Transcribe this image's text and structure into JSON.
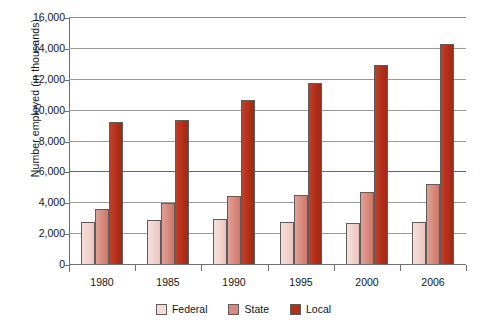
{
  "chart_data": {
    "type": "bar",
    "title": "",
    "xlabel": "",
    "ylabel": "Number employed (in thousands)",
    "categories": [
      "1980",
      "1985",
      "1990",
      "1995",
      "2000",
      "2006"
    ],
    "series": [
      {
        "name": "Federal",
        "color": "#f4dbd5",
        "values": [
          2800,
          2900,
          3000,
          2800,
          2750,
          2780
        ]
      },
      {
        "name": "State",
        "color": "#d8897d",
        "values": [
          3650,
          4000,
          4450,
          4550,
          4750,
          5230
        ]
      },
      {
        "name": "Local",
        "color": "#b5301a",
        "values": [
          9290,
          9420,
          10710,
          11800,
          12970,
          14320
        ]
      }
    ],
    "ylim": [
      0,
      16000
    ],
    "yticks": [
      "0",
      "2,000",
      "4,000",
      "6,000",
      "8,000",
      "10,000",
      "12,000",
      "14,000",
      "16,000"
    ],
    "ytick_values": [
      0,
      2000,
      4000,
      6000,
      8000,
      10000,
      12000,
      14000,
      16000
    ],
    "grid": true,
    "grid_highlight_value": 6000,
    "legend_position": "bottom"
  },
  "legend": {
    "items": [
      {
        "label": "Federal"
      },
      {
        "label": "State"
      },
      {
        "label": "Local"
      }
    ]
  }
}
